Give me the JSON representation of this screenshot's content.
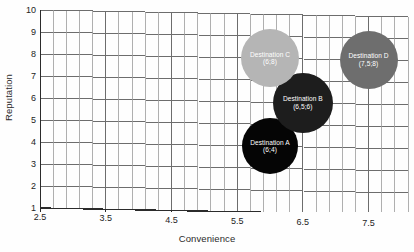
{
  "chart_data": {
    "type": "scatter",
    "title": "",
    "xlabel": "Convenience",
    "ylabel": "Reputation",
    "xlim": [
      2.5,
      8.1
    ],
    "ylim": [
      1,
      10
    ],
    "grid": true,
    "legend": "none",
    "x_ticks": [
      "2.5",
      "3.5",
      "4.5",
      "5.5",
      "6.5",
      "7.5"
    ],
    "x_tick_values": [
      2.5,
      3.5,
      4.5,
      5.5,
      6.5,
      7.5
    ],
    "x_minor_step": 0.2,
    "y_ticks": [
      "1",
      "2",
      "3",
      "4",
      "5",
      "6",
      "7",
      "8",
      "9",
      "10"
    ],
    "y_tick_values": [
      1,
      2,
      3,
      4,
      5,
      6,
      7,
      8,
      9,
      10
    ],
    "points": [
      {
        "label": "Destination A",
        "coord_text": "(6;4)",
        "x": 6.0,
        "y": 4.0,
        "size": 56,
        "color": "#050505"
      },
      {
        "label": "Destination B",
        "coord_text": "(6,5;6)",
        "x": 6.5,
        "y": 6.0,
        "size": 60,
        "color": "#1d1d1d"
      },
      {
        "label": "Destination C",
        "coord_text": "(6;8)",
        "x": 6.0,
        "y": 8.0,
        "size": 58,
        "color": "#b5b5b5"
      },
      {
        "label": "Destination D",
        "coord_text": "(7,5;8)",
        "x": 7.5,
        "y": 8.0,
        "size": 58,
        "color": "#6e6e6e"
      }
    ],
    "colors": {
      "grid_major": "#6d6d6d",
      "grid_minor": "#9b9b9b",
      "axis": "#2b2b2b",
      "background": "#fefefe",
      "text": "#232323"
    }
  }
}
